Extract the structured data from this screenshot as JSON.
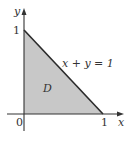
{
  "figure": {
    "region_label": "D",
    "line_label": "x + y = 1",
    "axes": {
      "x_label": "x",
      "y_label": "y",
      "origin_label": "0",
      "x_tick_label": "1",
      "y_tick_label": "1"
    },
    "colors": {
      "region_fill": "#c8c8c8",
      "line": "#2a2a2a",
      "axis": "#333333",
      "background": "#ffffff"
    }
  }
}
